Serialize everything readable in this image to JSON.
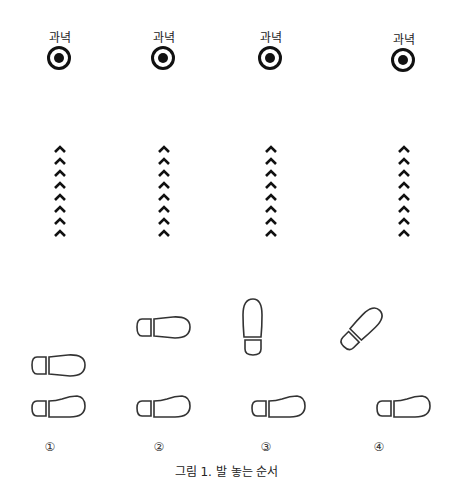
{
  "figure": {
    "caption": "그림 1. 발 놓는 순서",
    "columns": [
      {
        "target_label": "과녁",
        "number": "①",
        "x": 60
      },
      {
        "target_label": "과녁",
        "number": "②",
        "x": 164
      },
      {
        "target_label": "과녁",
        "number": "③",
        "x": 271
      },
      {
        "target_label": "과녁",
        "number": "④",
        "x": 405
      }
    ],
    "chevron_count": 8,
    "colors": {
      "stroke": "#111111",
      "foot_stroke": "#333333"
    }
  }
}
